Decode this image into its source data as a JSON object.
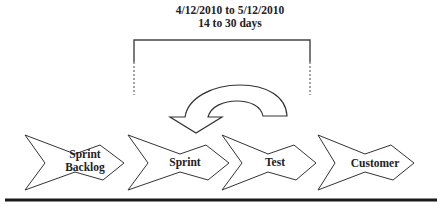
{
  "header": {
    "date_range": "4/12/2010 to 5/12/2010",
    "duration": "14 to 30 days"
  },
  "cycle_arrow": {
    "icon": "curved-return-arrow-icon",
    "direction": "counter-clockwise, pointing left-down"
  },
  "stages": [
    {
      "label_line1": "Sprint",
      "label_line2": "Backlog"
    },
    {
      "label_line1": "Sprint",
      "label_line2": ""
    },
    {
      "label_line1": "Test",
      "label_line2": ""
    },
    {
      "label_line1": "Customer",
      "label_line2": ""
    }
  ],
  "colors": {
    "stroke": "#333333",
    "fill": "#ffffff",
    "baseline": "#1a1a1a",
    "text": "#222222"
  }
}
